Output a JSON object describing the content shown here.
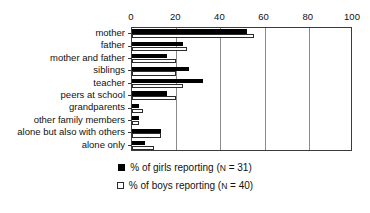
{
  "chart_data": {
    "type": "bar",
    "orientation": "horizontal",
    "title": "",
    "xlabel": "",
    "ylabel": "",
    "xlim": [
      0,
      100
    ],
    "xticks": [
      0,
      20,
      40,
      60,
      80,
      100
    ],
    "grid": true,
    "legend_position": "bottom",
    "categories": [
      "mother",
      "father",
      "mother and father",
      "siblings",
      "teacher",
      "peers at school",
      "grandparents",
      "other family members",
      "alone but also with others",
      "alone only"
    ],
    "series": [
      {
        "name": "% of girls reporting (N = 31)",
        "key": "girls",
        "color": "#000000",
        "style": "filled",
        "values": [
          52,
          23,
          16,
          26,
          32,
          16,
          3,
          3,
          13,
          6
        ]
      },
      {
        "name": "% of boys reporting (N = 40)",
        "key": "boys",
        "color": "#ffffff",
        "style": "open",
        "values": [
          55,
          25,
          20,
          20,
          23,
          20,
          5,
          3,
          13,
          10
        ]
      }
    ]
  },
  "legend": {
    "items": [
      {
        "swatch": "filled-square",
        "prefix": "% of girls reporting (",
        "n_symbol": "N",
        "suffix": " = 31)"
      },
      {
        "swatch": "open-square",
        "prefix": "% of boys reporting (",
        "n_symbol": "N",
        "suffix": " = 40)"
      }
    ]
  },
  "axis": {
    "tick_labels": [
      "0",
      "20",
      "40",
      "60",
      "80",
      "100"
    ]
  }
}
